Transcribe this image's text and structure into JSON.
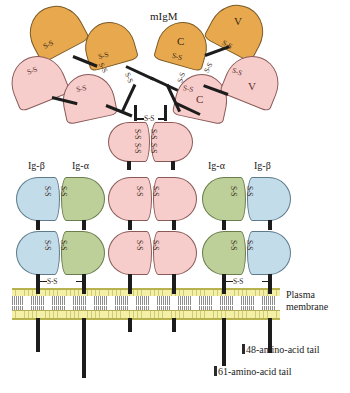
{
  "figure": {
    "title": "mIgM",
    "type": "B-cell receptor complex schematic"
  },
  "labels": {
    "igbeta_left": "Ig-β",
    "igalpha_left": "Ig-α",
    "igalpha_right": "Ig-α",
    "igbeta_right": "Ig-β",
    "plasma_membrane_line1": "Plasma",
    "plasma_membrane_line2": "membrane",
    "tail48": "48-amino-acid tail",
    "tail61": "61-amino-acid tail"
  },
  "domain_labels": {
    "variable": "V",
    "constant": "C",
    "disulfide": "S-S"
  },
  "colors": {
    "heavy_chain_orange": "#e8a94e",
    "light_chain_pink": "#f7cdcb",
    "ig_beta_blue": "#c3dcea",
    "ig_alpha_green": "#bdd09a",
    "membrane_head": "#f4f0a8",
    "membrane_outline": "#b9b54a",
    "connector": "#1c1c1c",
    "text": "#1a1a1a"
  },
  "domains": {
    "orange": [
      {
        "label": "",
        "x": 25,
        "y": 8,
        "w": 52,
        "h": 46,
        "rot": -30
      },
      {
        "label": "",
        "x": 82,
        "y": 22,
        "w": 48,
        "h": 42,
        "rot": -18
      },
      {
        "label": "C",
        "x": 158,
        "y": 22,
        "w": 48,
        "h": 42,
        "rot": 18
      },
      {
        "label": "V",
        "x": 212,
        "y": 7,
        "w": 50,
        "h": 45,
        "rot": 30
      }
    ],
    "pink_arms": [
      {
        "label": "",
        "x": 11,
        "y": 57,
        "w": 52,
        "h": 46,
        "rot": -24
      },
      {
        "label": "",
        "x": 62,
        "y": 73,
        "w": 50,
        "h": 44,
        "rot": -12
      },
      {
        "label": "C",
        "x": 176,
        "y": 72,
        "w": 50,
        "h": 44,
        "rot": 12
      },
      {
        "label": "V",
        "x": 226,
        "y": 56,
        "w": 52,
        "h": 46,
        "rot": 24
      }
    ],
    "columns": [
      {
        "chain": "Ig-β",
        "color": "blue",
        "x": 31
      },
      {
        "chain": "Ig-α",
        "color": "green",
        "x": 79
      },
      {
        "chain": "heavy",
        "color": "pink",
        "x": 127
      },
      {
        "chain": "heavy",
        "color": "pink",
        "x": 175
      },
      {
        "chain": "Ig-α",
        "color": "green",
        "x": 223
      },
      {
        "chain": "Ig-β",
        "color": "blue",
        "x": 271
      }
    ]
  }
}
